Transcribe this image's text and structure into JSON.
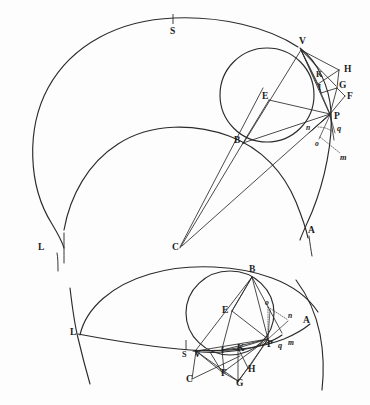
{
  "figure": {
    "background_color": "#fdfdfd",
    "ink_color": "#2b2b2b",
    "panels": [
      {
        "id": "upper",
        "name": "upper-figure",
        "labels": [
          {
            "key": "S",
            "text": "S",
            "style": "roman",
            "x": 174,
            "y": 34
          },
          {
            "key": "V",
            "text": "V",
            "style": "roman",
            "x": 303,
            "y": 47
          },
          {
            "key": "H",
            "text": "H",
            "style": "roman",
            "x": 345,
            "y": 73
          },
          {
            "key": "K",
            "text": "K",
            "style": "roman",
            "x": 320,
            "y": 78
          },
          {
            "key": "G",
            "text": "G",
            "style": "roman",
            "x": 341,
            "y": 88
          },
          {
            "key": "I",
            "text": "I",
            "style": "roman",
            "x": 322,
            "y": 90
          },
          {
            "key": "F",
            "text": "F",
            "style": "roman",
            "x": 348,
            "y": 98
          },
          {
            "key": "E",
            "text": "E",
            "style": "roman",
            "x": 271,
            "y": 99
          },
          {
            "key": "P",
            "text": "P",
            "style": "roman",
            "x": 337,
            "y": 118
          },
          {
            "key": "n",
            "text": "n",
            "style": "italic",
            "x": 312,
            "y": 129
          },
          {
            "key": "q",
            "text": "q",
            "style": "italic",
            "x": 338,
            "y": 129
          },
          {
            "key": "o",
            "text": "o",
            "style": "italic",
            "x": 320,
            "y": 143
          },
          {
            "key": "B",
            "text": "B",
            "style": "roman",
            "x": 241,
            "y": 142
          },
          {
            "key": "m",
            "text": "m",
            "style": "italic",
            "x": 343,
            "y": 158
          },
          {
            "key": "A",
            "text": "A",
            "style": "roman",
            "x": 311,
            "y": 232
          },
          {
            "key": "L",
            "text": "L",
            "style": "roman",
            "x": 41,
            "y": 249
          },
          {
            "key": "C",
            "text": "C",
            "style": "roman",
            "x": 175,
            "y": 249
          }
        ]
      },
      {
        "id": "lower",
        "name": "lower-figure",
        "labels": [
          {
            "key": "B",
            "text": "B",
            "style": "roman",
            "x": 252,
            "y": 272
          },
          {
            "key": "E",
            "text": "E",
            "style": "roman",
            "x": 228,
            "y": 311
          },
          {
            "key": "o",
            "text": "o",
            "style": "italic",
            "x": 269,
            "y": 306
          },
          {
            "key": "n",
            "text": "n",
            "style": "italic",
            "x": 290,
            "y": 318
          },
          {
            "key": "A",
            "text": "A",
            "style": "roman",
            "x": 306,
            "y": 322
          },
          {
            "key": "L",
            "text": "L",
            "style": "roman",
            "x": 75,
            "y": 333
          },
          {
            "key": "P",
            "text": "P",
            "style": "roman",
            "x": 270,
            "y": 344
          },
          {
            "key": "q",
            "text": "q",
            "style": "italic",
            "x": 282,
            "y": 345
          },
          {
            "key": "m",
            "text": "m",
            "style": "italic",
            "x": 292,
            "y": 342
          },
          {
            "key": "S",
            "text": "S",
            "style": "roman",
            "x": 186,
            "y": 355
          },
          {
            "key": "V",
            "text": "V",
            "style": "roman",
            "x": 199,
            "y": 355
          },
          {
            "key": "I",
            "text": "I",
            "style": "roman",
            "x": 224,
            "y": 352
          },
          {
            "key": "K",
            "text": "K",
            "style": "roman",
            "x": 240,
            "y": 350
          },
          {
            "key": "H",
            "text": "H",
            "style": "roman",
            "x": 250,
            "y": 371
          },
          {
            "key": "F",
            "text": "F",
            "style": "roman",
            "x": 224,
            "y": 375
          },
          {
            "key": "G",
            "text": "G",
            "style": "roman",
            "x": 239,
            "y": 384
          },
          {
            "key": "C",
            "text": "C",
            "style": "roman",
            "x": 190,
            "y": 381
          }
        ]
      }
    ]
  }
}
